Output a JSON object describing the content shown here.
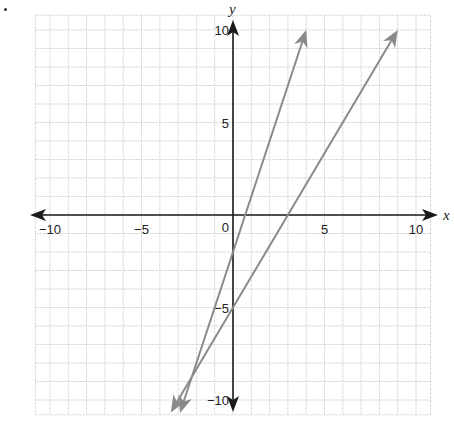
{
  "marker": "•",
  "chart_data": {
    "type": "line",
    "title": "",
    "xlabel": "x",
    "ylabel": "y",
    "xlim": [
      -10.8,
      10.8
    ],
    "ylim": [
      -10.8,
      10.8
    ],
    "grid": true,
    "grid_step": 1,
    "x_ticks": [
      {
        "value": -10,
        "label": "−10"
      },
      {
        "value": -5,
        "label": "−5"
      },
      {
        "value": 5,
        "label": "5"
      },
      {
        "value": 10,
        "label": "10"
      }
    ],
    "y_ticks": [
      {
        "value": 10,
        "label": "10"
      },
      {
        "value": 5,
        "label": "5"
      },
      {
        "value": -5,
        "label": "−5"
      },
      {
        "value": -10,
        "label": "−10"
      }
    ],
    "origin_label": "0",
    "series": [
      {
        "name": "line 1",
        "equation": "y = 3x - 2",
        "slope": 3,
        "intercept": -2,
        "x": [
          -2.9,
          4.0
        ],
        "y": [
          -10.7,
          10.0
        ],
        "color": "#8a8a8a",
        "arrows": "both"
      },
      {
        "name": "line 2",
        "equation": "y = (5/3)x - 5",
        "slope": 1.6667,
        "intercept": -5,
        "x": [
          -3.4,
          9.0
        ],
        "y": [
          -10.67,
          10.0
        ],
        "color": "#8a8a8a",
        "arrows": "both"
      }
    ],
    "intersection": {
      "x": -2.25,
      "y": -8.75
    },
    "colors": {
      "axis": "#1a1a1a",
      "grid": "#cfcfcf",
      "line": "#8a8a8a",
      "text": "#222222"
    }
  }
}
